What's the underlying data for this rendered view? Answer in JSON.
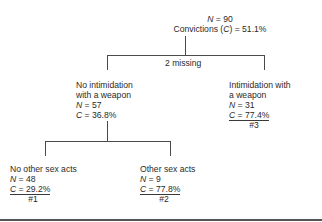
{
  "root": {
    "n_label": "N",
    "n_value": "= 90",
    "c_label_prefix": "Convictions (",
    "c_label_var": "C",
    "c_label_suffix": ") = 51.1%"
  },
  "split1_note": "2 missing",
  "nodes": [
    {
      "title_lines": [
        "No intimidation",
        "with a weapon"
      ],
      "n_label": "N",
      "n_value": "= 57",
      "c_label": "C",
      "c_value": "= 36.8%"
    },
    {
      "title_lines": [
        "Intimidation with",
        "a weapon"
      ],
      "n_label": "N",
      "n_value": "= 31",
      "c_label": "C",
      "c_value": "= 77.4%",
      "terminal_id": "#3"
    },
    {
      "title_lines": [
        "No other sex acts"
      ],
      "n_label": "N",
      "n_value": "= 48",
      "c_label": "C",
      "c_value": "= 29.2%",
      "terminal_id": "#1"
    },
    {
      "title_lines": [
        "Other sex acts"
      ],
      "n_label": "N",
      "n_value": "= 9",
      "c_label": "C",
      "c_value": "= 77.8%",
      "terminal_id": "#2"
    }
  ]
}
